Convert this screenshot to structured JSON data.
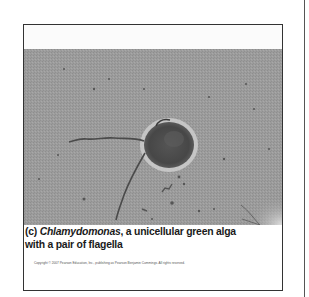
{
  "figure": {
    "panel_label": "(c)",
    "caption_genus": "Chlamydomonas",
    "caption_rest_line1": ", a unicellular green alga",
    "caption_line2": "with a pair of flagella",
    "copyright": "Copyright © 2007 Pearson Education, Inc., publishing as Pearson Benjamin Cummings. All rights reserved.",
    "image_description": "light micrograph of a Chlamydomonas cell with two flagella",
    "colors": {
      "background_gray": "#9c9c9c",
      "cell_body": "#4a4a4a",
      "halo": "#d8d8d8",
      "caption_text": "#1a1a1a"
    }
  }
}
